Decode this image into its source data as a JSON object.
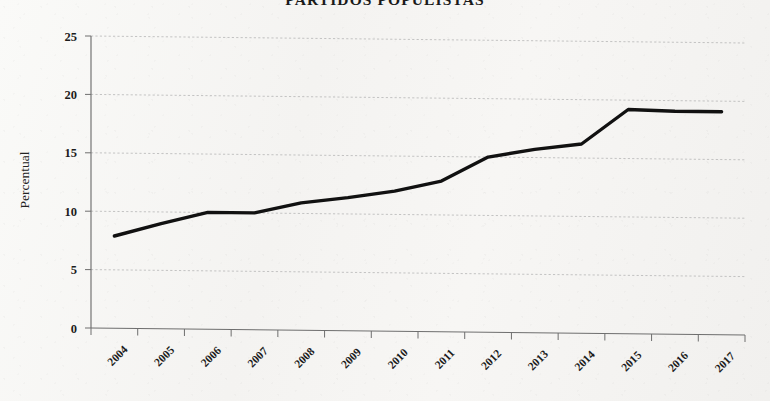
{
  "chart_data": {
    "type": "line",
    "title": "PARTIDOS POPULISTAS",
    "xlabel": "",
    "ylabel": "Percentual",
    "categories": [
      "2004",
      "2005",
      "2006",
      "2007",
      "2008",
      "2009",
      "2010",
      "2011",
      "2012",
      "2013",
      "2014",
      "2015",
      "2016",
      "2017"
    ],
    "values": [
      7.9,
      9.0,
      10.0,
      10.0,
      10.9,
      11.4,
      12.0,
      12.9,
      15.0,
      15.7,
      16.2,
      19.2,
      19.1,
      19.1
    ],
    "series": [
      {
        "name": "Partidos populistas",
        "values": [
          7.9,
          9.0,
          10.0,
          10.0,
          10.9,
          11.4,
          12.0,
          12.9,
          15.0,
          15.7,
          16.2,
          19.2,
          19.1,
          19.1
        ]
      }
    ],
    "ylim": [
      0,
      25
    ],
    "yticks": [
      "0",
      "5",
      "10",
      "15",
      "20",
      "25"
    ],
    "ytick_values": [
      0,
      5,
      10,
      15,
      20,
      25
    ],
    "grid": true,
    "legend": false,
    "legend_position": "none",
    "line_color": "#111111",
    "grid_color": "#b9b9b9",
    "background_color": "#f6f5f3"
  },
  "axes": {
    "y_title": "Percentual"
  }
}
